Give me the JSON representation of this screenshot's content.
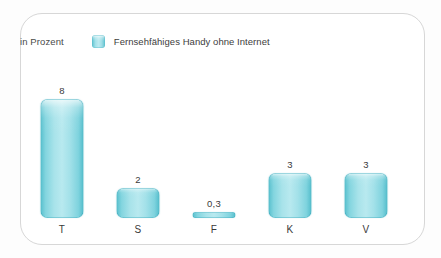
{
  "chart_data": {
    "type": "bar",
    "title": "",
    "subtitle": "",
    "unit_label": "in Prozent",
    "xlabel": "",
    "ylabel": "",
    "grid": false,
    "legend_position": "top",
    "legend": [
      {
        "name": "Fernsehfähiges Handy ohne Internet",
        "color": "#9fdfe8"
      }
    ],
    "categories": [
      "T",
      "S",
      "F",
      "K",
      "V"
    ],
    "values": [
      8,
      2,
      0.3,
      3,
      3
    ],
    "value_labels": [
      "8",
      "2",
      "0,3",
      "3",
      "3"
    ],
    "ylim": [
      0,
      8.8
    ],
    "series": [
      {
        "name": "Fernsehfähiges Handy ohne Internet",
        "values": [
          8,
          2,
          0.3,
          3,
          3
        ]
      }
    ]
  },
  "colors": {
    "bar_light": "#b8e9ef",
    "bar_mid": "#9fdfe8",
    "bar_edge": "#53bdcb",
    "frame_border": "#d7d7d7",
    "text": "#3a3a3a",
    "background": "#ffffff"
  }
}
